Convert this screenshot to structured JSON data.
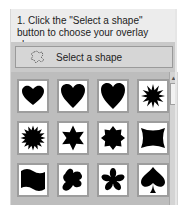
{
  "instruction": "1. Click the \"Select a shape\" button to choose your overlay shape.",
  "select_button": {
    "label": "Select a shape",
    "icon": "puzzle-shape-icon"
  },
  "shapes": [
    {
      "name": "heart-wide"
    },
    {
      "name": "heart"
    },
    {
      "name": "heart-tall"
    },
    {
      "name": "starburst-12"
    },
    {
      "name": "starburst-16"
    },
    {
      "name": "star-6"
    },
    {
      "name": "star-8"
    },
    {
      "name": "bow-tie"
    },
    {
      "name": "wave-flag"
    },
    {
      "name": "blob"
    },
    {
      "name": "flower"
    },
    {
      "name": "spade"
    }
  ],
  "scrollbar": {
    "up_arrow": "▲"
  }
}
